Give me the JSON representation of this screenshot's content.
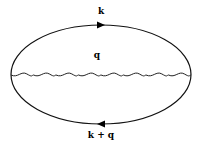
{
  "diagram": {
    "type": "feynman-diagram",
    "labels": {
      "top_fermion": "k",
      "internal_boson": "q",
      "bottom_fermion": "k + q"
    },
    "fermion_loop": {
      "top_arrow_direction": "right",
      "bottom_arrow_direction": "left"
    },
    "boson_line": {
      "style": "wavy",
      "wave_count": 8
    },
    "colors": {
      "line": "#000000",
      "background": "#ffffff"
    }
  }
}
